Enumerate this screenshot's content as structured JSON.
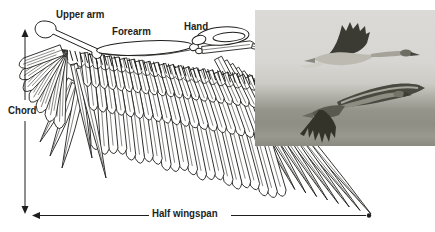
{
  "figure": {
    "background": "#ffffff",
    "ink": "#1e1e1c",
    "labels": {
      "upper_arm": "Upper arm",
      "forearm": "Forearm",
      "hand": "Hand",
      "chord": "Chord",
      "half_wingspan": "Half wingspan"
    },
    "photo": {
      "subject": "two geese in flight",
      "sky": "#d8d7d3",
      "field": "#908f86",
      "bird_dark": "#3b3a33",
      "bird_mid": "#8e8d82",
      "bird_light": "#bdbbb1"
    }
  }
}
